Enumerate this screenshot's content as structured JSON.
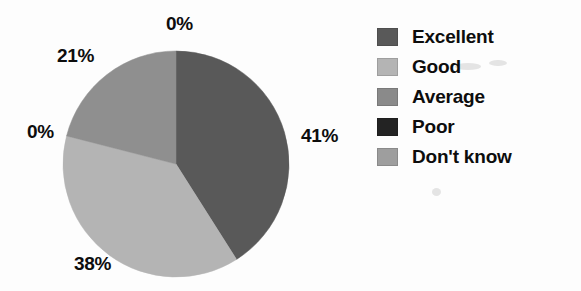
{
  "chart_data": {
    "type": "pie",
    "title": "",
    "labels": [
      "Excellent",
      "Good",
      "Average",
      "Poor",
      "Don't know"
    ],
    "values": [
      41,
      38,
      0,
      0,
      21
    ],
    "value_labels": [
      "41%",
      "38%",
      "0%",
      "0%",
      "21%"
    ],
    "unit": "%",
    "colors": [
      "#595959",
      "#b4b4b4",
      "#8a8a8a",
      "#232323",
      "#8f8f8f"
    ],
    "legend_position": "right",
    "start_angle_deg": 0,
    "direction": "clockwise",
    "background": "#ffffff",
    "text_color": "#0d0d0d"
  },
  "slices": [
    {
      "name": "Excellent",
      "value": 41,
      "label": "41%",
      "color": "#595959",
      "start_deg": 0,
      "end_deg": 147.6
    },
    {
      "name": "Good",
      "value": 38,
      "label": "38%",
      "color": "#b4b4b4",
      "start_deg": 147.6,
      "end_deg": 284.4
    },
    {
      "name": "Average",
      "value": 0,
      "label": "0%",
      "color": "#8a8a8a",
      "start_deg": 284.4,
      "end_deg": 284.4
    },
    {
      "name": "Poor",
      "value": 0,
      "label": "0%",
      "color": "#232323",
      "start_deg": 284.4,
      "end_deg": 284.4
    },
    {
      "name": "Don't know",
      "value": 21,
      "label": "21%",
      "color": "#8f8f8f",
      "start_deg": 284.4,
      "end_deg": 360
    }
  ],
  "callouts": {
    "top": "0%",
    "upper_left": "21%",
    "left": "0%",
    "right": "41%",
    "bottom_left": "38%"
  },
  "legend": {
    "items": [
      {
        "label": "Excellent",
        "color": "#595959"
      },
      {
        "label": "Good",
        "color": "#b4b4b4"
      },
      {
        "label": "Average",
        "color": "#8a8a8a"
      },
      {
        "label": "Poor",
        "color": "#232323"
      },
      {
        "label": "Don't know",
        "color": "#9e9e9e"
      }
    ]
  },
  "geometry": {
    "center_x": 114,
    "center_y": 114,
    "radius": 113
  }
}
